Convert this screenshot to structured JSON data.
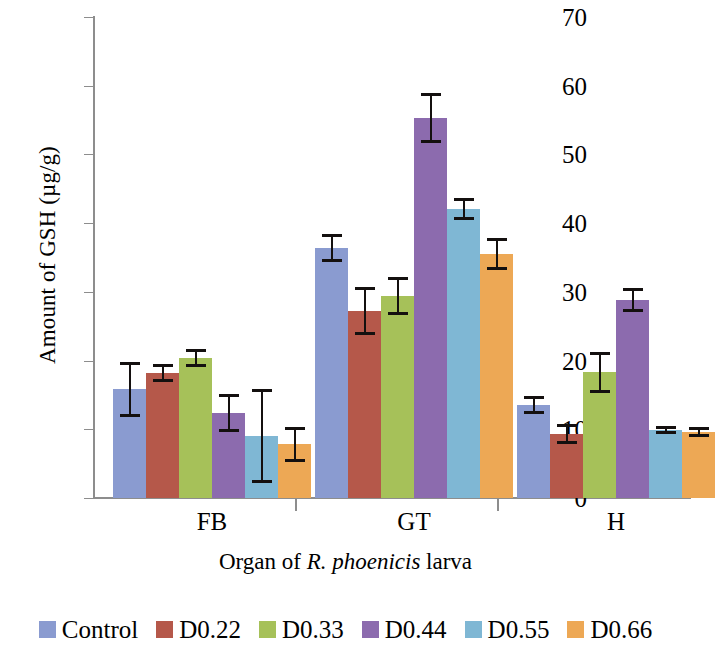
{
  "chart_data": {
    "type": "bar",
    "title": "",
    "xlabel": "Organ of R. phoenicis larva",
    "xlabel_parts": [
      {
        "text": "Organ of ",
        "italic": false
      },
      {
        "text": "R. phoenicis",
        "italic": true
      },
      {
        "text": " larva",
        "italic": false
      }
    ],
    "ylabel": "Amount of GSH (µg/g)",
    "ylim": [
      0,
      70
    ],
    "yticks": [
      0,
      10,
      20,
      30,
      40,
      50,
      60,
      70
    ],
    "grid": false,
    "legend_position": "bottom",
    "categories": [
      "FB",
      "GT",
      "H"
    ],
    "series": [
      {
        "name": "Control",
        "color": "#8a9bd0",
        "values": [
          15.8,
          36.4,
          13.5
        ],
        "errors": [
          4.0,
          2.0,
          1.3
        ]
      },
      {
        "name": "D0.22",
        "color": "#b5584a",
        "values": [
          18.2,
          27.2,
          9.3
        ],
        "errors": [
          1.3,
          3.5,
          1.4
        ]
      },
      {
        "name": "D0.33",
        "color": "#a6c159",
        "values": [
          20.4,
          29.4,
          18.3
        ],
        "errors": [
          1.3,
          2.8,
          3.0
        ]
      },
      {
        "name": "D0.44",
        "color": "#8c6bae",
        "values": [
          12.4,
          55.3,
          28.8
        ],
        "errors": [
          2.8,
          3.7,
          1.8
        ]
      },
      {
        "name": "D0.55",
        "color": "#7fb7d4",
        "values": [
          9.0,
          42.0,
          9.9
        ],
        "errors": [
          6.8,
          1.6,
          0.6
        ]
      },
      {
        "name": "D0.66",
        "color": "#eda855",
        "values": [
          7.8,
          35.5,
          9.6
        ],
        "errors": [
          2.6,
          2.3,
          0.7
        ]
      }
    ]
  },
  "axes": {
    "y_title": "Amount of GSH (µg/g)",
    "y_tick_labels": [
      "0",
      "10",
      "20",
      "30",
      "40",
      "50",
      "60",
      "70"
    ],
    "x_group_labels": [
      "FB",
      "GT",
      "H"
    ],
    "x_title_prefix": "Organ of ",
    "x_title_italic": "R. phoenicis",
    "x_title_suffix": " larva"
  },
  "legend": {
    "items": [
      {
        "label": "Control",
        "color": "#8a9bd0"
      },
      {
        "label": "D0.22",
        "color": "#b5584a"
      },
      {
        "label": "D0.33",
        "color": "#a6c159"
      },
      {
        "label": "D0.44",
        "color": "#8c6bae"
      },
      {
        "label": "D0.55",
        "color": "#7fb7d4"
      },
      {
        "label": "D0.66",
        "color": "#eda855"
      }
    ]
  }
}
